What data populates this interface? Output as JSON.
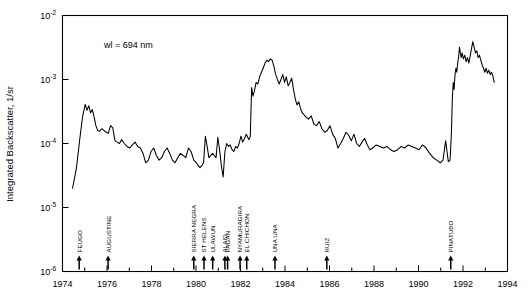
{
  "chart_data": {
    "type": "line",
    "title": "",
    "xlabel": "",
    "ylabel": "Integrated Backscatter, 1/sr",
    "annotation": "wl = 694 nm",
    "xlim": [
      1974,
      1994
    ],
    "ylim": [
      1e-06,
      0.01
    ],
    "yscale": "log",
    "xscale": "linear",
    "grid": false,
    "legend": null,
    "x_ticks": [
      1974,
      1976,
      1978,
      1980,
      1982,
      1984,
      1986,
      1988,
      1990,
      1992,
      1994
    ],
    "x_tick_labels": [
      "1974",
      "1976",
      "1978",
      "1980",
      "1982",
      "1984",
      "1986",
      "1988",
      "1990",
      "1992",
      "1994"
    ],
    "x_minor_ticks": [
      1975,
      1977,
      1979,
      1981,
      1983,
      1985,
      1987,
      1989,
      1991,
      1993
    ],
    "y_ticks": [
      0.01,
      0.001,
      0.0001,
      1e-05,
      1e-06
    ],
    "y_tick_labels": [
      "10-2",
      "10-3",
      "10-4",
      "10-5",
      "10-6"
    ],
    "y_tick_mantissa": [
      "10",
      "10",
      "10",
      "10",
      "10"
    ],
    "y_tick_exponent": [
      "-2",
      "-3",
      "-4",
      "-5",
      "-6"
    ],
    "series": [
      {
        "name": "Integrated Backscatter",
        "x": [
          1974.45,
          1974.62,
          1974.78,
          1974.9,
          1975.02,
          1975.1,
          1975.18,
          1975.26,
          1975.34,
          1975.42,
          1975.5,
          1975.58,
          1975.66,
          1975.76,
          1975.86,
          1975.96,
          1976.06,
          1976.16,
          1976.26,
          1976.36,
          1976.46,
          1976.56,
          1976.66,
          1976.78,
          1976.9,
          1977.02,
          1977.14,
          1977.26,
          1977.38,
          1977.5,
          1977.62,
          1977.74,
          1977.86,
          1977.98,
          1978.1,
          1978.22,
          1978.34,
          1978.46,
          1978.58,
          1978.7,
          1978.82,
          1978.94,
          1979.06,
          1979.18,
          1979.3,
          1979.42,
          1979.54,
          1979.66,
          1979.78,
          1979.9,
          1980.02,
          1980.1,
          1980.18,
          1980.26,
          1980.34,
          1980.42,
          1980.5,
          1980.58,
          1980.66,
          1980.74,
          1980.82,
          1980.9,
          1980.98,
          1981.06,
          1981.14,
          1981.22,
          1981.3,
          1981.38,
          1981.46,
          1981.54,
          1981.62,
          1981.7,
          1981.78,
          1981.86,
          1981.94,
          1982.02,
          1982.1,
          1982.18,
          1982.26,
          1982.32,
          1982.38,
          1982.44,
          1982.5,
          1982.56,
          1982.62,
          1982.7,
          1982.78,
          1982.86,
          1982.94,
          1983.02,
          1983.1,
          1983.18,
          1983.26,
          1983.34,
          1983.42,
          1983.5,
          1983.58,
          1983.66,
          1983.74,
          1983.82,
          1983.9,
          1983.98,
          1984.06,
          1984.14,
          1984.22,
          1984.3,
          1984.38,
          1984.46,
          1984.54,
          1984.62,
          1984.7,
          1984.78,
          1984.86,
          1984.94,
          1985.06,
          1985.18,
          1985.3,
          1985.42,
          1985.54,
          1985.66,
          1985.78,
          1985.9,
          1986.02,
          1986.14,
          1986.26,
          1986.38,
          1986.5,
          1986.62,
          1986.74,
          1986.86,
          1986.98,
          1987.1,
          1987.22,
          1987.34,
          1987.46,
          1987.58,
          1987.7,
          1987.82,
          1987.94,
          1988.1,
          1988.26,
          1988.42,
          1988.58,
          1988.74,
          1988.9,
          1989.06,
          1989.22,
          1989.38,
          1989.54,
          1989.7,
          1989.86,
          1990.02,
          1990.18,
          1990.34,
          1990.5,
          1990.66,
          1990.82,
          1990.98,
          1991.1,
          1991.22,
          1991.34,
          1991.42,
          1991.48,
          1991.52,
          1991.56,
          1991.6,
          1991.64,
          1991.68,
          1991.72,
          1991.76,
          1991.8,
          1991.84,
          1991.88,
          1991.92,
          1991.96,
          1992.02,
          1992.08,
          1992.14,
          1992.2,
          1992.26,
          1992.32,
          1992.38,
          1992.44,
          1992.5,
          1992.56,
          1992.62,
          1992.68,
          1992.74,
          1992.8,
          1992.86,
          1992.92,
          1992.98,
          1993.04,
          1993.1,
          1993.16,
          1993.22,
          1993.28,
          1993.34,
          1993.4
        ],
        "y": [
          2e-05,
          4e-05,
          0.00012,
          0.00026,
          0.00041,
          0.00033,
          0.00039,
          0.0003,
          0.00034,
          0.00026,
          0.00019,
          0.00016,
          0.000155,
          0.00017,
          0.00016,
          0.00015,
          0.000145,
          0.00019,
          0.000175,
          0.00011,
          0.000105,
          0.0001,
          0.000115,
          0.0001,
          9e-05,
          8.5e-05,
          9.5e-05,
          0.000105,
          9e-05,
          8.5e-05,
          7e-05,
          5e-05,
          5.5e-05,
          7.5e-05,
          8.5e-05,
          6.5e-05,
          5.5e-05,
          6e-05,
          7.5e-05,
          8.5e-05,
          7e-05,
          5.5e-05,
          5e-05,
          6e-05,
          7e-05,
          6.5e-05,
          6e-05,
          8.5e-05,
          7.5e-05,
          5.5e-05,
          5e-05,
          4.5e-05,
          4.2e-05,
          4.5e-05,
          5e-05,
          0.00013,
          9e-05,
          6e-05,
          6.5e-05,
          7e-05,
          6.5e-05,
          6e-05,
          0.000125,
          8e-05,
          4.5e-05,
          3e-05,
          7.5e-05,
          0.0001,
          9e-05,
          9.5e-05,
          8e-05,
          7.5e-05,
          9e-05,
          8.5e-05,
          0.0001,
          0.00013,
          0.000105,
          0.00012,
          0.00014,
          0.000125,
          0.000115,
          0.00013,
          0.00075,
          0.00055,
          0.00065,
          0.0009,
          0.00085,
          0.0011,
          0.0013,
          0.0015,
          0.0018,
          0.002,
          0.0019,
          0.0021,
          0.002,
          0.0016,
          0.0012,
          0.001,
          0.00085,
          0.001,
          0.0012,
          0.0009,
          0.0011,
          0.0008,
          0.0009,
          0.00105,
          0.0007,
          0.0005,
          0.0004,
          0.00045,
          0.00035,
          0.0003,
          0.00028,
          0.00026,
          0.00024,
          0.00027,
          0.0002,
          0.00019,
          0.00022,
          0.00017,
          0.00015,
          0.00016,
          0.00019,
          0.00014,
          0.00012,
          8.5e-05,
          0.0001,
          0.00012,
          0.00015,
          0.000135,
          0.00011,
          0.00014,
          0.0001,
          9e-05,
          0.000105,
          0.00012,
          9.5e-05,
          8e-05,
          8.5e-05,
          9.5e-05,
          9e-05,
          8.5e-05,
          9e-05,
          8e-05,
          7.5e-05,
          8e-05,
          9e-05,
          8.5e-05,
          9.5e-05,
          9e-05,
          8.5e-05,
          8e-05,
          9.5e-05,
          8.5e-05,
          7e-05,
          6e-05,
          5.5e-05,
          5e-05,
          5.5e-05,
          0.00011,
          5.2e-05,
          5.5e-05,
          0.00015,
          0.0005,
          0.0009,
          0.0007,
          0.0012,
          0.0015,
          0.0013,
          0.0018,
          0.0022,
          0.0032,
          0.0026,
          0.0022,
          0.0026,
          0.0021,
          0.0024,
          0.0019,
          0.0022,
          0.0018,
          0.0023,
          0.003,
          0.0039,
          0.0032,
          0.0026,
          0.0028,
          0.0022,
          0.0024,
          0.002,
          0.0017,
          0.0015,
          0.0013,
          0.0015,
          0.00125,
          0.0014,
          0.0012,
          0.0013,
          0.00115,
          0.0009
        ]
      }
    ],
    "eruptions": [
      {
        "name": "FEUGO",
        "year": 1974.75
      },
      {
        "name": "AUGUSTINE",
        "year": 1976.05
      },
      {
        "name": "SIERRA NEGRA",
        "year": 1979.9
      },
      {
        "name": "ST HELENS",
        "year": 1980.36
      },
      {
        "name": "ULAWUN",
        "year": 1980.75
      },
      {
        "name": "ALAID",
        "year": 1981.3
      },
      {
        "name": "PAGAN",
        "year": 1981.42
      },
      {
        "name": "NYAMURAGIRA",
        "year": 1981.98
      },
      {
        "name": "EL CHICHON",
        "year": 1982.28
      },
      {
        "name": "UNA UNA",
        "year": 1983.55
      },
      {
        "name": "RUIZ",
        "year": 1985.88
      },
      {
        "name": "PINATUBO",
        "year": 1991.45
      }
    ]
  },
  "colors": {
    "background": "#ffffff",
    "axis": "#000000",
    "dataline": "#000000",
    "text": "#000000"
  }
}
